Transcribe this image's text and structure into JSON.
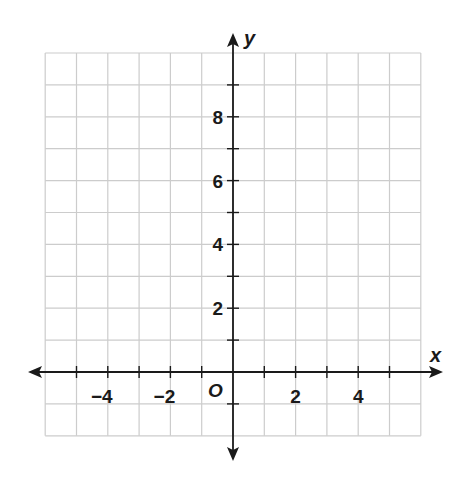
{
  "chart_data": {
    "type": "coordinate-plane",
    "title": "",
    "xlabel": "x",
    "ylabel": "y",
    "origin_label": "O",
    "xlim": [
      -6,
      6
    ],
    "ylim": [
      -2,
      10
    ],
    "grid": true,
    "grid_step": 1,
    "x_ticks": [
      -5,
      -4,
      -3,
      -2,
      -1,
      1,
      2,
      3,
      4,
      5
    ],
    "y_ticks": [
      -1,
      1,
      2,
      3,
      4,
      5,
      6,
      7,
      8,
      9
    ],
    "x_tick_labels": [
      "−4",
      "−2",
      "2",
      "4"
    ],
    "x_tick_label_values": [
      -4,
      -2,
      2,
      4
    ],
    "y_tick_labels": [
      "2",
      "4",
      "6",
      "8"
    ],
    "y_tick_label_values": [
      2,
      4,
      6,
      8
    ],
    "series": []
  },
  "colors": {
    "grid": "#cccccc",
    "axis": "#1a1a1a",
    "background": "#ffffff"
  }
}
